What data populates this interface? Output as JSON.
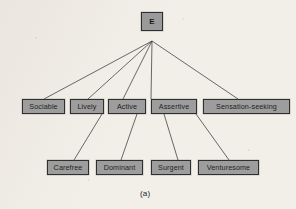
{
  "figure": {
    "caption": "(a)",
    "root": {
      "id": "E",
      "label": "E"
    },
    "level_two": [
      {
        "id": "sociable",
        "label": "Sociable"
      },
      {
        "id": "lively",
        "label": "Lively"
      },
      {
        "id": "active",
        "label": "Active"
      },
      {
        "id": "assertive",
        "label": "Assertive"
      },
      {
        "id": "sensation-seeking",
        "label": "Sensation-seeking"
      }
    ],
    "level_three": [
      {
        "id": "carefree",
        "label": "Carefree"
      },
      {
        "id": "dominant",
        "label": "Dominant"
      },
      {
        "id": "surgent",
        "label": "Surgent"
      },
      {
        "id": "venturesome",
        "label": "Venturesome"
      }
    ],
    "edges": [
      {
        "from": "E",
        "to": "sociable"
      },
      {
        "from": "E",
        "to": "lively"
      },
      {
        "from": "E",
        "to": "active"
      },
      {
        "from": "E",
        "to": "assertive"
      },
      {
        "from": "E",
        "to": "sensation-seeking"
      },
      {
        "from": "lively",
        "to": "carefree"
      },
      {
        "from": "active",
        "to": "dominant"
      },
      {
        "from": "assertive",
        "to": "surgent"
      },
      {
        "from": "assertive",
        "to": "venturesome"
      }
    ],
    "colors": {
      "node_fill": "#9d9d9d",
      "node_border": "#2f2f2f",
      "background": "#f2efe9",
      "edge": "#3a3a3a",
      "text": "#151515"
    }
  }
}
